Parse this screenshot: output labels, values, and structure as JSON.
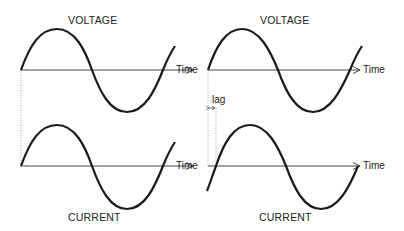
{
  "diagrams": [
    {
      "position": "left",
      "top_label": "VOLTAGE",
      "bottom_label": "CURRENT",
      "axis_label": "Time",
      "phase": "in-phase"
    },
    {
      "position": "right",
      "top_label": "VOLTAGE",
      "bottom_label": "CURRENT",
      "axis_label": "Time",
      "phase": "lagging",
      "lag_label": "lag"
    }
  ],
  "colors": {
    "wave": "#1a1a1a",
    "axis": "#444444",
    "guide": "#888888"
  }
}
